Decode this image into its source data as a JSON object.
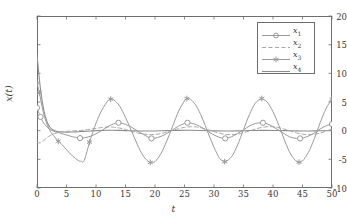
{
  "chart_data": {
    "type": "line",
    "title": "",
    "xlabel": "t",
    "ylabel": "x(t)",
    "xlim": [
      0,
      50
    ],
    "ylim": [
      -10,
      20
    ],
    "xticks": [
      0,
      5,
      10,
      15,
      20,
      25,
      30,
      35,
      40,
      45,
      50
    ],
    "yticks": [
      -10,
      -5,
      0,
      5,
      10,
      15,
      20
    ],
    "grid": false,
    "legend_position": "top-right",
    "series": [
      {
        "name": "x1",
        "label": "x",
        "subscript": "1",
        "style": "solid-circle-markers",
        "color": "#9a9a9a",
        "marker": "circle",
        "initial_value": 4.0,
        "steady_amplitude": 1.4,
        "period": 12.75,
        "x": [
          0,
          0.5,
          1,
          1.5,
          2,
          2.5,
          3,
          4,
          5,
          6,
          7,
          7.3,
          8,
          9,
          10,
          11,
          12,
          13,
          13.8,
          14,
          15,
          16,
          17,
          18,
          19,
          19.4,
          20,
          21,
          22,
          23,
          24,
          25,
          25.5,
          26,
          27,
          28,
          29,
          30,
          31,
          31.9,
          32,
          33,
          34,
          35,
          36,
          37,
          38,
          38.3,
          39,
          40,
          41,
          42,
          43,
          44,
          44.6,
          45,
          46,
          47,
          48,
          49,
          50
        ],
        "y": [
          4.0,
          2.6,
          1.55,
          0.85,
          0.35,
          0.05,
          -0.15,
          -0.45,
          -0.75,
          -1.05,
          -1.25,
          -1.3,
          -1.25,
          -1.0,
          -0.55,
          0.05,
          0.7,
          1.2,
          1.38,
          1.37,
          1.1,
          0.6,
          0.0,
          -0.65,
          -1.2,
          -1.35,
          -1.3,
          -1.0,
          -0.5,
          0.15,
          0.8,
          1.25,
          1.38,
          1.35,
          1.05,
          0.5,
          -0.15,
          -0.75,
          -1.2,
          -1.35,
          -1.33,
          -1.05,
          -0.5,
          0.15,
          0.8,
          1.25,
          1.38,
          1.38,
          1.2,
          0.7,
          0.05,
          -0.6,
          -1.15,
          -1.35,
          -1.35,
          -1.3,
          -0.95,
          -0.4,
          0.3,
          0.85,
          1.15
        ],
        "markers_x": [
          0,
          0.6,
          7.3,
          13.8,
          19.4,
          25.5,
          31.9,
          38.3,
          44.6,
          50
        ],
        "markers_y": [
          4.0,
          2.4,
          -1.3,
          1.38,
          -1.35,
          1.38,
          -1.35,
          1.38,
          -1.35,
          1.15
        ]
      },
      {
        "name": "x2",
        "label": "x",
        "subscript": "2",
        "style": "dashed",
        "color": "#a8a8a8",
        "marker": "none",
        "initial_value": -2.0,
        "steady_amplitude": 0.7,
        "period": 12.75,
        "x": [
          0,
          0.5,
          1,
          1.5,
          2,
          2.5,
          3,
          4,
          5,
          6,
          7,
          8,
          9,
          10,
          11,
          12,
          13,
          14,
          15,
          16,
          17,
          18,
          19,
          20,
          21,
          22,
          23,
          24,
          25,
          26,
          27,
          28,
          29,
          30,
          31,
          32,
          33,
          34,
          35,
          36,
          37,
          38,
          39,
          40,
          41,
          42,
          43,
          44,
          45,
          46,
          47,
          48,
          49,
          50
        ],
        "y": [
          -2.0,
          -2.15,
          -1.85,
          -1.4,
          -1.0,
          -0.7,
          -0.5,
          -0.25,
          -0.12,
          -0.05,
          0.0,
          0.1,
          0.25,
          0.4,
          0.55,
          0.65,
          0.6,
          0.45,
          0.2,
          -0.1,
          -0.38,
          -0.58,
          -0.68,
          -0.65,
          -0.5,
          -0.25,
          0.05,
          0.35,
          0.58,
          0.68,
          0.65,
          0.45,
          0.15,
          -0.18,
          -0.45,
          -0.65,
          -0.7,
          -0.6,
          -0.35,
          -0.05,
          0.28,
          0.55,
          0.68,
          0.68,
          0.52,
          0.25,
          -0.08,
          -0.4,
          -0.62,
          -0.7,
          -0.62,
          -0.4,
          -0.08,
          0.28
        ]
      },
      {
        "name": "x3",
        "label": "x",
        "subscript": "3",
        "style": "solid-star-markers",
        "color": "#9a9a9a",
        "marker": "asterisk",
        "initial_value": 8.3,
        "steady_amplitude": 5.55,
        "period": 12.75,
        "x": [
          0,
          0.4,
          1,
          1.5,
          2,
          2.5,
          3,
          3.6,
          4,
          5,
          6,
          7,
          7.5,
          8,
          8.9,
          9,
          10,
          11,
          12,
          12.5,
          13,
          14,
          15,
          16,
          17,
          18,
          19,
          19.2,
          20,
          21,
          22,
          23,
          24,
          25,
          25.4,
          26,
          27,
          28,
          29,
          30,
          31,
          31.8,
          32,
          33,
          34,
          35,
          36,
          37,
          38,
          38.1,
          39,
          40,
          41,
          42,
          43,
          44,
          44.4,
          45,
          46,
          47,
          48,
          49,
          50
        ],
        "y": [
          8.3,
          6.6,
          3.5,
          1.7,
          0.4,
          -0.5,
          -1.1,
          -1.85,
          -2.2,
          -3.3,
          -4.4,
          -5.2,
          -5.35,
          -5.2,
          -2.0,
          -1.7,
          1.3,
          3.6,
          5.2,
          5.5,
          5.4,
          4.3,
          2.3,
          0.0,
          -2.4,
          -4.4,
          -5.5,
          -5.55,
          -5.4,
          -4.0,
          -1.8,
          0.8,
          3.4,
          5.2,
          5.6,
          5.5,
          4.3,
          2.2,
          -0.4,
          -2.9,
          -4.9,
          -5.4,
          -5.4,
          -4.5,
          -2.5,
          0.2,
          2.8,
          4.8,
          5.6,
          5.6,
          5.0,
          3.3,
          0.9,
          -1.8,
          -4.1,
          -5.4,
          -5.5,
          -5.3,
          -3.8,
          -1.4,
          1.4,
          3.9,
          5.5
        ],
        "markers_x": [
          0,
          0.4,
          3.6,
          8.9,
          12.5,
          19.2,
          25.4,
          31.8,
          38.1,
          44.4,
          50
        ],
        "markers_y": [
          8.3,
          6.6,
          -1.85,
          -2.0,
          5.5,
          -5.55,
          5.6,
          -5.4,
          5.6,
          -5.5,
          5.5
        ]
      },
      {
        "name": "x4",
        "label": "x",
        "subscript": "4",
        "style": "solid",
        "color": "#8d8d8d",
        "marker": "none",
        "initial_value": 13.2,
        "steady_amplitude": 0.1,
        "period": 12.75,
        "x": [
          0,
          0.3,
          0.6,
          1,
          1.4,
          1.8,
          2.2,
          2.6,
          3,
          3.5,
          4,
          5,
          6,
          7,
          8,
          9,
          10,
          12,
          14,
          16,
          18,
          20,
          22,
          24,
          26,
          28,
          30,
          32,
          34,
          36,
          38,
          40,
          42,
          44,
          46,
          48,
          50
        ],
        "y": [
          13.2,
          10.0,
          7.2,
          4.4,
          2.5,
          1.3,
          0.6,
          0.2,
          0.0,
          -0.15,
          -0.2,
          -0.25,
          -0.22,
          -0.18,
          -0.12,
          -0.06,
          0.0,
          0.06,
          0.05,
          -0.02,
          -0.07,
          -0.05,
          0.0,
          0.05,
          0.06,
          0.02,
          -0.04,
          -0.06,
          -0.03,
          0.02,
          0.05,
          0.04,
          0.0,
          -0.04,
          -0.05,
          -0.02,
          0.03
        ]
      }
    ]
  },
  "axes": {
    "xlabel": "t",
    "ylabel": "x(t)",
    "xtick_labels": [
      "0",
      "5",
      "10",
      "15",
      "20",
      "25",
      "30",
      "35",
      "40",
      "45",
      "50"
    ],
    "ytick_labels": [
      "20",
      "15",
      "10",
      "5",
      "0",
      "-5",
      "-10"
    ]
  },
  "legend": {
    "entries": [
      {
        "label": "x",
        "sub": "1",
        "name": "legend-entry-x1"
      },
      {
        "label": "x",
        "sub": "2",
        "name": "legend-entry-x2"
      },
      {
        "label": "x",
        "sub": "3",
        "name": "legend-entry-x3"
      },
      {
        "label": "x",
        "sub": "4",
        "name": "legend-entry-x4"
      }
    ]
  },
  "colors": {
    "axis": "#6e6e6e",
    "curve_light": "#9a9a9a",
    "curve_dash": "#a8a8a8",
    "curve_solid": "#8d8d8d",
    "text": "#3a3a3a",
    "background": "#ffffff"
  }
}
